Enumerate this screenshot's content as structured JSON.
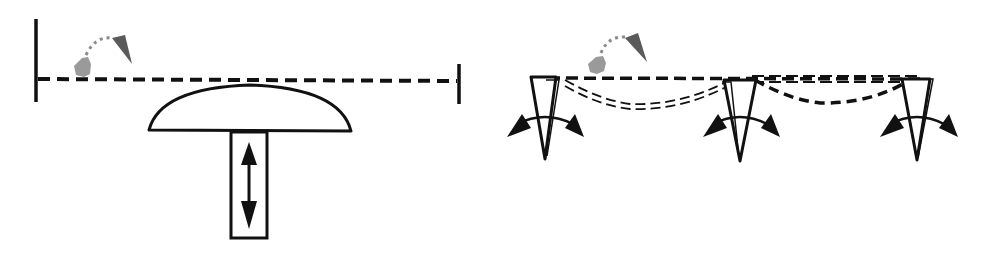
{
  "diagram": {
    "colors": {
      "stroke": "#111111",
      "object_light": "#9a9a9a",
      "object_dark": "#5a5a5a",
      "background": "#ffffff"
    },
    "left_panel": {
      "elements": [
        {
          "id": "left-wall",
          "type": "vertical-bar"
        },
        {
          "id": "right-wall",
          "type": "vertical-bar"
        },
        {
          "id": "membrane",
          "type": "dashed-line"
        },
        {
          "id": "mushroom-cap",
          "type": "dome"
        },
        {
          "id": "piston-stem",
          "type": "rectangle"
        },
        {
          "id": "vertical-motion-arrow",
          "type": "double-headed-arrow",
          "direction": "up-down"
        },
        {
          "id": "hopping-object",
          "type": "grey-blob-with-dotted-trajectory-arrow"
        }
      ]
    },
    "right_panel": {
      "actuator_count": 3,
      "elements": [
        {
          "id": "membrane-flat",
          "type": "dashed-line"
        },
        {
          "id": "membrane-wave-1",
          "type": "double-dashed-curve"
        },
        {
          "id": "membrane-wave-2",
          "type": "dashed-curve"
        },
        {
          "id": "actuator-1",
          "type": "rotating-triangle",
          "motion": "rocking"
        },
        {
          "id": "actuator-2",
          "type": "rotating-triangle",
          "motion": "rocking"
        },
        {
          "id": "actuator-3",
          "type": "rotating-triangle",
          "motion": "rocking"
        },
        {
          "id": "hopping-object",
          "type": "grey-blob-with-dotted-trajectory-arrow"
        }
      ]
    }
  }
}
